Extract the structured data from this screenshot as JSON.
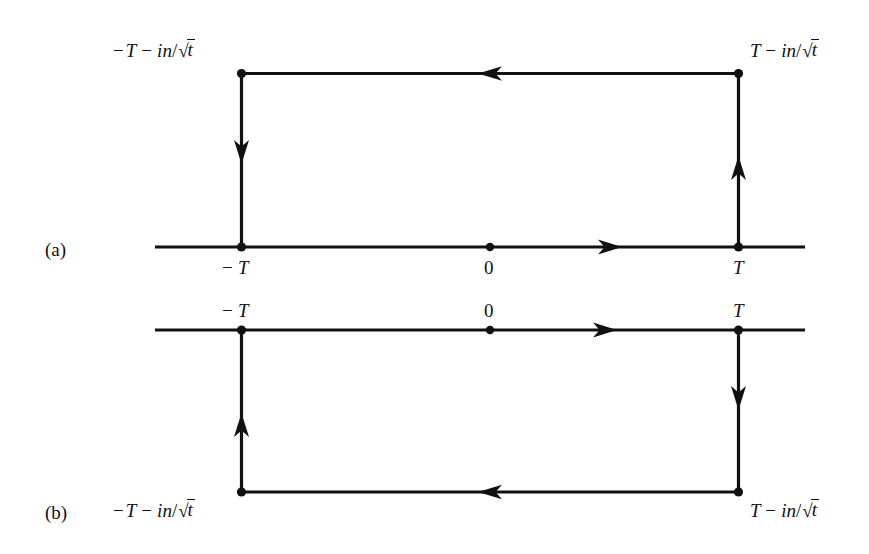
{
  "figure": {
    "title": "",
    "background": "#ffffff",
    "stroke_color": "#111111",
    "panels": [
      {
        "key": "a",
        "panel_label": "(a)",
        "axis_label_left": "− T",
        "axis_label_center": "0",
        "axis_label_right": "T",
        "corner_label_top_left": "− T − in/√t",
        "corner_label_top_right": "T − in/√t",
        "orientation": "rectangle above the real axis",
        "arrow_directions": {
          "real_axis": "right",
          "top_edge": "left",
          "left_edge": "down",
          "right_edge": "up"
        }
      },
      {
        "key": "b",
        "panel_label": "(b)",
        "axis_label_left": "− T",
        "axis_label_center": "0",
        "axis_label_right": "T",
        "corner_label_bottom_left": "− T − in/√t",
        "corner_label_bottom_right": "T − in/√t",
        "orientation": "rectangle below the real axis",
        "arrow_directions": {
          "real_axis": "right",
          "bottom_edge": "left",
          "left_edge": "up",
          "right_edge": "down"
        }
      }
    ],
    "label_parts": {
      "minus": "−",
      "T": "T",
      "in": "in",
      "slash": "/",
      "sqrt": "√",
      "t": "t",
      "zero": "0"
    }
  }
}
